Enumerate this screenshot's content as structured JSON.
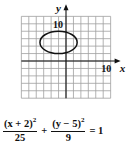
{
  "chart_data": {
    "type": "line",
    "subtype": "conic-ellipse-graph",
    "title": "",
    "xlabel": "x",
    "ylabel": "y",
    "x_tick_label": "10",
    "y_tick_label": "10",
    "grid": true,
    "grid_spacing": 2,
    "xlim": [
      -12,
      12
    ],
    "ylim": [
      -10,
      12
    ],
    "ellipse": {
      "center": [
        -2,
        5
      ],
      "semi_axis_x": 5,
      "semi_axis_y": 3
    },
    "equation": {
      "term1_num": "(x + 2)",
      "term1_exp": "2",
      "term1_den": "25",
      "plus": "+",
      "term2_num": "(y − 5)",
      "term2_exp": "2",
      "term2_den": "9",
      "equals": "= 1"
    }
  },
  "colors": {
    "grid": "#9a9a9a",
    "axis": "#111111",
    "curve": "#111111"
  }
}
